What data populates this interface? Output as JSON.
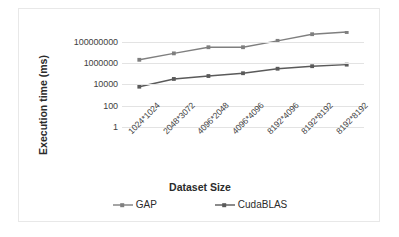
{
  "chart_data": {
    "type": "line",
    "title": "",
    "xlabel": "Dataset Size",
    "ylabel": "Execution time (ms)",
    "categories": [
      "1024*1024",
      "2048*3072",
      "4096*2048",
      "4096*4096",
      "8192*4096",
      "8192*8192",
      "8192*8192"
    ],
    "yscale": "log",
    "ylim": [
      1,
      1000000000
    ],
    "yticks": [
      1,
      100,
      10000,
      1000000,
      100000000
    ],
    "ytick_labels": [
      "1",
      "100",
      "10000",
      "1000000",
      "100000000"
    ],
    "grid": true,
    "legend_position": "bottom",
    "series": [
      {
        "name": "GAP",
        "color": "#7f7f7f",
        "marker": "square",
        "values": [
          2000000,
          8000000,
          30000000,
          30000000,
          120000000,
          500000000,
          800000000
        ]
      },
      {
        "name": "CudaBLAS",
        "color": "#5a5a5a",
        "marker": "square",
        "values": [
          6000,
          32000,
          60000,
          110000,
          290000,
          500000,
          700000
        ]
      }
    ]
  },
  "axes": {
    "y_title": "Execution time (ms)",
    "x_title": "Dataset Size"
  },
  "legend": {
    "items": [
      {
        "label": "GAP"
      },
      {
        "label": "CudaBLAS"
      }
    ]
  },
  "colors": {
    "series_gap": "#7f7f7f",
    "series_cudablas": "#5a5a5a",
    "gridline": "#e3e3e3",
    "text": "#3f3f3f",
    "border": "#e8e8e8"
  }
}
